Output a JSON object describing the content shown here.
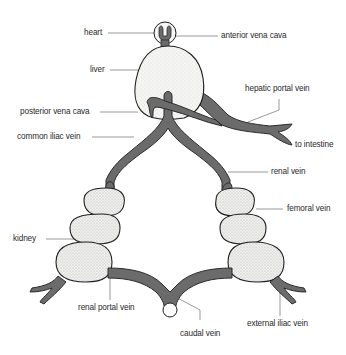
{
  "diagram": {
    "colors": {
      "vein": "#6b6b6b",
      "vein_outline": "#2b2b2b",
      "organ_fill": "#f4f4f2",
      "organ_outline": "#1e1e1e",
      "leader_line": "#555555",
      "label_text": "#2a2a2a"
    },
    "labels": {
      "heart": "heart",
      "anterior_vena_cava": "anterior vena cava",
      "liver": "liver",
      "hepatic_portal_vein": "hepatic portal vein",
      "posterior_vena_cava": "posterior vena cava",
      "common_iliac_vein": "common iliac vein",
      "to_intestine": "to intestine",
      "renal_vein": "renal vein",
      "femoral_vein": "femoral vein",
      "kidney": "kidney",
      "renal_portal_vein": "renal portal vein",
      "caudal_vein": "caudal vein",
      "external_iliac_vein": "external iliac vein"
    }
  }
}
